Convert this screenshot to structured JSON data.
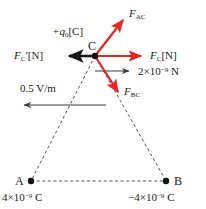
{
  "figure": {
    "type": "physics-force-diagram",
    "colors": {
      "vector_red": "#e8251f",
      "vector_black": "#1a1a1a",
      "dashed_line": "#555555",
      "background": "#ffffff"
    }
  },
  "vertices": {
    "a": {
      "name": "A",
      "charge": "4×10⁻⁹ C",
      "charge_value": 4e-09,
      "x": 31,
      "y": 181
    },
    "b": {
      "name": "B",
      "charge": "−4×10⁻⁹ C",
      "charge_value": -4e-09,
      "x": 166,
      "y": 181
    },
    "c": {
      "name": "C",
      "test_charge": "+q₀[C]",
      "x": 95,
      "y": 56
    }
  },
  "vectors": {
    "f_ac": {
      "label_base": "F",
      "label_sub": "AC",
      "color": "#e8251f",
      "from": [
        95,
        56
      ],
      "to": [
        126,
        16
      ]
    },
    "f_bc": {
      "label_base": "F",
      "label_sub": "BC",
      "color": "#e8251f",
      "from": [
        95,
        56
      ],
      "to": [
        121,
        96
      ]
    },
    "f_c": {
      "label_base": "F",
      "label_sub": "C",
      "label_unit": "[N]",
      "color": "#e8251f",
      "from": [
        95,
        56
      ],
      "to": [
        145,
        56
      ]
    },
    "f_c_prime": {
      "label_base": "F",
      "label_sub": "C",
      "label_prime": "′",
      "label_unit": "[N]",
      "color": "#1a1a1a",
      "from": [
        95,
        56
      ],
      "to": [
        66,
        56
      ]
    }
  },
  "scales": {
    "force_scale": {
      "label": "2×10⁻⁹ N",
      "value": 2e-09,
      "unit": "N",
      "arrow_from": [
        95,
        71
      ],
      "arrow_to": [
        131,
        71
      ],
      "color": "#1a1a1a"
    },
    "field_scale": {
      "label": "0.5 V/m",
      "value": 0.5,
      "unit": "V/m",
      "arrow_from": [
        106,
        105
      ],
      "arrow_to": [
        22,
        105
      ],
      "color": "#1a1a1a"
    }
  },
  "labels": {
    "test_charge": "+q",
    "test_charge_sub": "0",
    "test_charge_unit": "[C]",
    "vertex_c": "C",
    "vertex_a": "A",
    "vertex_b": "B",
    "f_ac_base": "F",
    "f_ac_sub": "AC",
    "f_bc_base": "F",
    "f_bc_sub": "BC",
    "f_c_base": "F",
    "f_c_sub": "C",
    "f_c_unit": "[N]",
    "f_cp_base": "F",
    "f_cp_sub": "C",
    "f_cp_prime": "′",
    "f_cp_unit": "[N]",
    "force_scale_text": "2×10",
    "force_scale_exp": "−9",
    "force_scale_unit": " N",
    "field_scale_text": "0.5 V/m",
    "charge_a_text": "4×10",
    "charge_a_exp": "−9",
    "charge_a_unit": " C",
    "charge_b_text": "−4×10",
    "charge_b_exp": "−9",
    "charge_b_unit": " C"
  }
}
